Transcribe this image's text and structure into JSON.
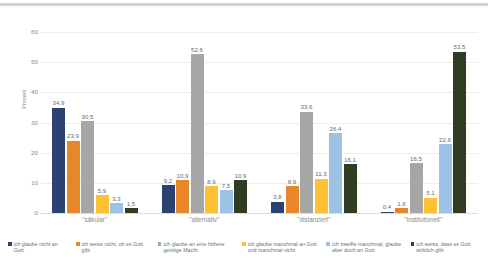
{
  "chart_data": {
    "type": "bar",
    "title": "",
    "xlabel": "",
    "ylabel": "Prozent",
    "ylim": [
      0,
      60
    ],
    "yticks": [
      0,
      10,
      20,
      30,
      40,
      50,
      60
    ],
    "grid": true,
    "legend_position": "bottom",
    "categories": [
      "\"säkular\"",
      "\"alternativ\"",
      "\"distanziert\"",
      "\"institutionell\""
    ],
    "series": [
      {
        "name": "ich glaube nicht an Gott.",
        "color": "#2e4272",
        "values": [
          34.9,
          9.2,
          3.8,
          0.4
        ],
        "labels": [
          "34,9",
          "9,2",
          "3,8",
          "0,4"
        ]
      },
      {
        "name": "ich weiss nicht, ob es Gott gibt",
        "color": "#e8862a",
        "values": [
          23.9,
          10.9,
          8.9,
          1.6
        ],
        "labels": [
          "23,9",
          "10,9",
          "8,9",
          "1,6"
        ]
      },
      {
        "name": "ich glaube an eine höhere geistige Macht",
        "color": "#a6a6a6",
        "values": [
          30.5,
          52.6,
          33.6,
          16.5
        ],
        "labels": [
          "30,5",
          "52,6",
          "33,6",
          "16,5"
        ]
      },
      {
        "name": "ich glaube manchmal an Gott und manchmal nicht",
        "color": "#fcc134",
        "values": [
          5.9,
          8.9,
          11.3,
          5.1
        ],
        "labels": [
          "5,9",
          "8,9",
          "11,3",
          "5,1"
        ]
      },
      {
        "name": "ich zweifle manchmal, glaube aber doch an Gott",
        "color": "#9cc3e5",
        "values": [
          3.3,
          7.5,
          26.4,
          22.8
        ],
        "labels": [
          "3,3",
          "7,5",
          "26,4",
          "22,8"
        ]
      },
      {
        "name": "ich weiss, dass es Gott wirklich gibt",
        "color": "#2f3d23",
        "values": [
          1.5,
          10.9,
          16.1,
          53.5
        ],
        "labels": [
          "1,5",
          "10,9",
          "16,1",
          "53,5"
        ]
      }
    ]
  },
  "axis": {
    "y_label": "Prozent",
    "y_ticks": [
      "60",
      "50",
      "40",
      "30",
      "20",
      "10",
      "0"
    ]
  },
  "categories": {
    "c0": "\"säkular\"",
    "c1": "\"alternativ\"",
    "c2": "\"distanziert\"",
    "c3": "\"institutionell\""
  },
  "legend": {
    "items": [
      "ich glaube nicht an Gott.",
      "ich weiss nicht, ob es Gott gibt",
      "ich glaube an eine höhere geistige Macht",
      "ich glaube manchmal an Gott und manchmal nicht",
      "ich zweifle manchmal, glaube aber doch an Gott",
      "ich weiss, dass es Gott wirklich gibt"
    ]
  }
}
